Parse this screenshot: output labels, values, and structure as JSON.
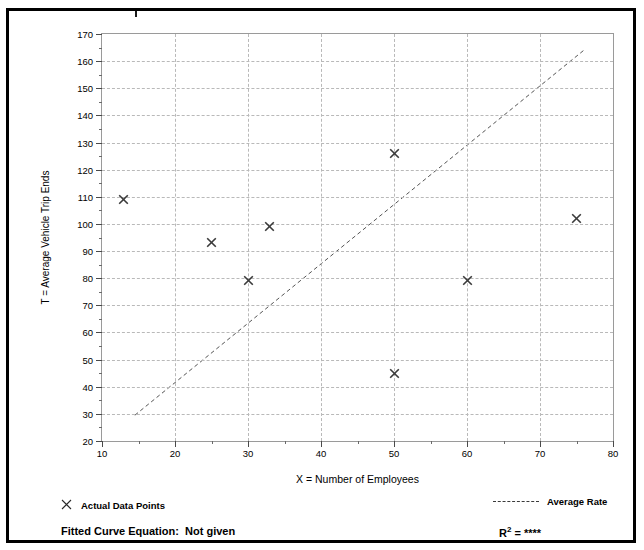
{
  "chart_data": {
    "type": "scatter",
    "title": "",
    "xlabel": "X = Number of Employees",
    "ylabel": "T = Average Vehicle Trip Ends",
    "xlim": [
      10,
      80
    ],
    "ylim": [
      20,
      170
    ],
    "xticks": [
      10,
      20,
      30,
      40,
      50,
      60,
      70,
      80
    ],
    "yticks": [
      20,
      30,
      40,
      50,
      60,
      70,
      80,
      90,
      100,
      110,
      120,
      130,
      140,
      150,
      160,
      170
    ],
    "x_minor_step": 5,
    "y_minor_step": 5,
    "grid": true,
    "legend_position": "below-axes",
    "series": [
      {
        "name": "Actual Data Points",
        "type": "scatter",
        "marker": "x",
        "points": [
          {
            "x": 13,
            "y": 109
          },
          {
            "x": 25,
            "y": 93
          },
          {
            "x": 30,
            "y": 79
          },
          {
            "x": 33,
            "y": 99
          },
          {
            "x": 50,
            "y": 126
          },
          {
            "x": 50,
            "y": 45
          },
          {
            "x": 60,
            "y": 79
          },
          {
            "x": 75,
            "y": 102
          }
        ]
      },
      {
        "name": "Average Rate",
        "type": "line",
        "style": "dashed",
        "points": [
          {
            "x": 14.5,
            "y": 29.5
          },
          {
            "x": 76,
            "y": 164
          }
        ]
      }
    ],
    "annotations": {
      "fitted_curve_equation_label": "Fitted Curve Equation:",
      "fitted_curve_equation_value": "Not given",
      "r_squared_label": "R",
      "r_squared_exponent": "2",
      "r_squared_equals": "=",
      "r_squared_value": "****"
    }
  },
  "legend": {
    "actual_points_label": "Actual Data Points",
    "average_rate_label": "Average Rate",
    "marker_glyph": "✕"
  },
  "colors": {
    "border": "#000000",
    "grid": "#b9b9b9",
    "axis": "#9a9a9a",
    "marker": "#3a3a3a",
    "trendline": "#555555"
  }
}
